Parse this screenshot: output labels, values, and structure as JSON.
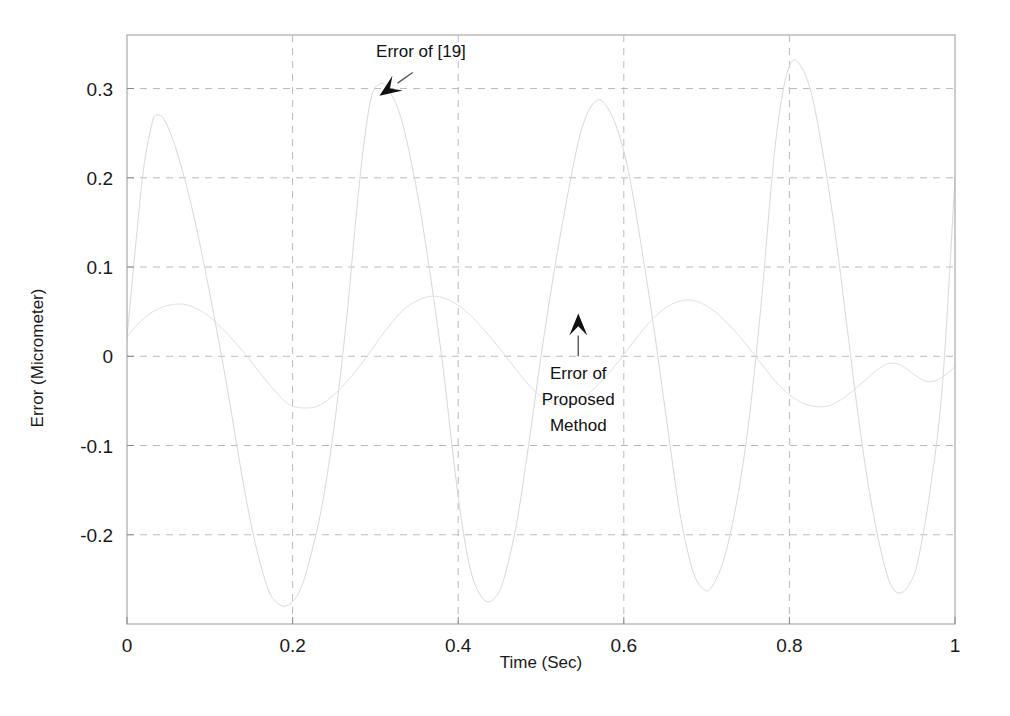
{
  "chart_data": {
    "type": "line",
    "title": "",
    "xlabel": "Time (Sec)",
    "ylabel": "Error (Micrometer)",
    "xlim": [
      0,
      1
    ],
    "ylim": [
      -0.3,
      0.36
    ],
    "grid": true,
    "grid_style": "dashed",
    "legend": "none",
    "xticks": [
      "0",
      "0.2",
      "0.4",
      "0.6",
      "0.8",
      "1"
    ],
    "xtick_values": [
      0,
      0.2,
      0.4,
      0.6,
      0.8,
      1
    ],
    "yticks": [
      "0.3",
      "0.2",
      "0.1",
      "0",
      "-0.1",
      "-0.2"
    ],
    "ytick_values": [
      0.3,
      0.2,
      0.1,
      0,
      -0.1,
      -0.2
    ],
    "annotations": [
      {
        "name": "error-of-19-annotation",
        "text": "Error of [19]",
        "text_x": 0.355,
        "text_y": 0.335,
        "arrow_from_x": 0.345,
        "arrow_from_y": 0.318,
        "arrow_to_x": 0.305,
        "arrow_to_y": 0.292,
        "arrow_direction": "down-left"
      },
      {
        "name": "error-of-proposed-method-annotation",
        "text": "Error of Proposed Method",
        "lines": [
          "Error of",
          "Proposed",
          "Method"
        ],
        "text_x": 0.545,
        "text_y": -0.025,
        "arrow_from_x": 0.545,
        "arrow_from_y": 0.0,
        "arrow_to_x": 0.545,
        "arrow_to_y": 0.048,
        "arrow_direction": "up"
      }
    ],
    "series": [
      {
        "name": "Error of [19]",
        "color": "#d8d8d8",
        "line_width": 1,
        "description": "Large amplitude oscillation, period approx 0.25 s, amplitude approx 0.27 to 0.33 micrometer",
        "x": [
          0,
          0.01,
          0.02,
          0.03,
          0.035,
          0.045,
          0.06,
          0.08,
          0.1,
          0.12,
          0.14,
          0.155,
          0.17,
          0.18,
          0.19,
          0.2,
          0.21,
          0.22,
          0.235,
          0.25,
          0.265,
          0.275,
          0.285,
          0.295,
          0.305,
          0.315,
          0.33,
          0.345,
          0.36,
          0.38,
          0.395,
          0.405,
          0.415,
          0.425,
          0.435,
          0.445,
          0.455,
          0.47,
          0.485,
          0.5,
          0.515,
          0.53,
          0.545,
          0.555,
          0.565,
          0.575,
          0.59,
          0.605,
          0.62,
          0.635,
          0.65,
          0.665,
          0.675,
          0.685,
          0.695,
          0.705,
          0.72,
          0.735,
          0.75,
          0.765,
          0.78,
          0.79,
          0.8,
          0.81,
          0.825,
          0.84,
          0.855,
          0.87,
          0.885,
          0.9,
          0.915,
          0.925,
          0.935,
          0.945,
          0.955,
          0.97,
          0.985,
          1.0
        ],
        "y": [
          0.02,
          0.12,
          0.21,
          0.26,
          0.27,
          0.265,
          0.23,
          0.16,
          0.07,
          -0.03,
          -0.14,
          -0.21,
          -0.26,
          -0.275,
          -0.28,
          -0.275,
          -0.26,
          -0.23,
          -0.17,
          -0.08,
          0.04,
          0.14,
          0.23,
          0.29,
          0.305,
          0.3,
          0.27,
          0.21,
          0.13,
          0.0,
          -0.12,
          -0.19,
          -0.24,
          -0.265,
          -0.275,
          -0.27,
          -0.25,
          -0.19,
          -0.1,
          0.0,
          0.09,
          0.17,
          0.24,
          0.27,
          0.285,
          0.285,
          0.26,
          0.21,
          0.13,
          0.04,
          -0.06,
          -0.16,
          -0.21,
          -0.245,
          -0.26,
          -0.26,
          -0.23,
          -0.17,
          -0.08,
          0.05,
          0.21,
          0.285,
          0.325,
          0.33,
          0.3,
          0.23,
          0.14,
          0.03,
          -0.08,
          -0.17,
          -0.235,
          -0.26,
          -0.265,
          -0.255,
          -0.23,
          -0.15,
          -0.03,
          0.2
        ]
      },
      {
        "name": "Error of Proposed Method",
        "color": "#e0e0e0",
        "line_width": 1,
        "description": "Small amplitude oscillation, period approx 0.25 s, amplitude approx 0.06 micrometer",
        "x": [
          0,
          0.01,
          0.025,
          0.04,
          0.055,
          0.07,
          0.085,
          0.1,
          0.115,
          0.13,
          0.145,
          0.16,
          0.175,
          0.19,
          0.2,
          0.215,
          0.23,
          0.245,
          0.26,
          0.275,
          0.29,
          0.305,
          0.32,
          0.335,
          0.35,
          0.365,
          0.38,
          0.395,
          0.41,
          0.425,
          0.44,
          0.455,
          0.47,
          0.485,
          0.5,
          0.515,
          0.53,
          0.545,
          0.56,
          0.575,
          0.59,
          0.605,
          0.62,
          0.635,
          0.65,
          0.665,
          0.68,
          0.695,
          0.71,
          0.725,
          0.74,
          0.755,
          0.77,
          0.785,
          0.8,
          0.815,
          0.83,
          0.845,
          0.86,
          0.875,
          0.89,
          0.905,
          0.92,
          0.935,
          0.95,
          0.965,
          0.98,
          1.0
        ],
        "y": [
          0.022,
          0.033,
          0.046,
          0.054,
          0.058,
          0.058,
          0.053,
          0.044,
          0.031,
          0.016,
          0.0,
          -0.018,
          -0.035,
          -0.05,
          -0.056,
          -0.058,
          -0.056,
          -0.047,
          -0.034,
          -0.018,
          0.0,
          0.02,
          0.038,
          0.053,
          0.062,
          0.067,
          0.066,
          0.06,
          0.05,
          0.036,
          0.02,
          0.003,
          -0.015,
          -0.032,
          -0.045,
          -0.053,
          -0.055,
          -0.05,
          -0.04,
          -0.026,
          -0.01,
          0.008,
          0.026,
          0.042,
          0.054,
          0.061,
          0.063,
          0.059,
          0.05,
          0.037,
          0.022,
          0.005,
          -0.013,
          -0.03,
          -0.043,
          -0.052,
          -0.056,
          -0.056,
          -0.05,
          -0.04,
          -0.028,
          -0.016,
          -0.008,
          -0.01,
          -0.02,
          -0.028,
          -0.026,
          -0.012
        ]
      }
    ]
  },
  "axes": {
    "box_color": "#aaaaaa",
    "grid_color": "#bbbbbb",
    "background": "#ffffff"
  }
}
